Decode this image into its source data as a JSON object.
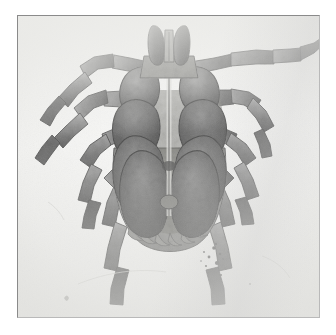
{
  "page": {
    "background_color": "#ffffff",
    "width": 336,
    "height": 335
  },
  "plate": {
    "name": "photographic-plate",
    "description": "Grayscale photomicrograph of a hard tick, ventral aspect",
    "border_color": "#8a8a8a",
    "background_color": "#f2f2f0",
    "left": 17,
    "top": 15,
    "width": 303,
    "height": 303
  },
  "specimen": {
    "common_name": "Tick",
    "view": "ventral",
    "body_color_dark": "#4a4a4a",
    "body_color_mid": "#6e6e6e",
    "body_color_light": "#9a9a9a",
    "outline_color": "#2a2a2a",
    "parts": [
      {
        "label": "capitulum",
        "name": "capitulum"
      },
      {
        "label": "palp-left",
        "name": "palp-left"
      },
      {
        "label": "palp-right",
        "name": "palp-right"
      },
      {
        "label": "hypostome",
        "name": "hypostome"
      },
      {
        "label": "basis capituli",
        "name": "basis-capituli"
      },
      {
        "label": "idiosoma",
        "name": "idiosoma"
      },
      {
        "label": "coxa I left",
        "name": "coxa-1-left"
      },
      {
        "label": "coxa I right",
        "name": "coxa-1-right"
      },
      {
        "label": "coxa II left",
        "name": "coxa-2-left"
      },
      {
        "label": "coxa II right",
        "name": "coxa-2-right"
      },
      {
        "label": "coxa III left",
        "name": "coxa-3-left"
      },
      {
        "label": "coxa III right",
        "name": "coxa-3-right"
      },
      {
        "label": "coxa IV left",
        "name": "coxa-4-left"
      },
      {
        "label": "coxa IV right",
        "name": "coxa-4-right"
      },
      {
        "label": "festoons",
        "name": "festoons"
      },
      {
        "label": "leg I left",
        "name": "leg-1-left"
      },
      {
        "label": "leg I right",
        "name": "leg-1-right"
      },
      {
        "label": "leg II left",
        "name": "leg-2-left"
      },
      {
        "label": "leg II right",
        "name": "leg-2-right"
      },
      {
        "label": "leg III left",
        "name": "leg-3-left"
      },
      {
        "label": "leg III right",
        "name": "leg-3-right"
      },
      {
        "label": "leg IV left",
        "name": "leg-4-left"
      },
      {
        "label": "leg IV right",
        "name": "leg-4-right"
      },
      {
        "label": "debris speckle",
        "name": "debris-artifact"
      }
    ]
  }
}
